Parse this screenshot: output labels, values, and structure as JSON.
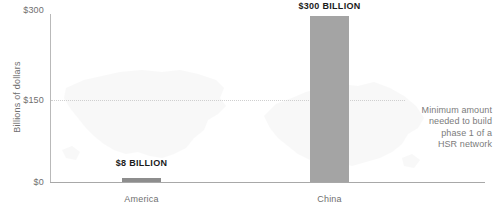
{
  "chart_data": {
    "type": "bar",
    "title": "",
    "subtitle": "",
    "xlabel": "",
    "ylabel": "Billions of dollars",
    "categories": [
      "America",
      "China"
    ],
    "values": [
      8,
      300
    ],
    "value_labels": [
      "$8 BILLION",
      "$300 BILLION"
    ],
    "ylim": [
      0,
      300
    ],
    "yticks": [
      0,
      150,
      300
    ],
    "ytick_labels": [
      "$0",
      "$150",
      "$300"
    ],
    "grid": "horizontal-dotted-at-150-only",
    "legend": "none",
    "annotations": [
      {
        "name": "minimum-amount-note",
        "value": 150,
        "lines": [
          "Minimum amount",
          "needed to build",
          "phase 1 of a",
          "HSR network"
        ]
      }
    ],
    "colors": {
      "bar_america": "#8d8d8d",
      "bar_china": "#a4a4a4",
      "axis": "#b9b9b9",
      "gridline": "#cfcfcf",
      "tick_text": "#6f6f6f",
      "value_text": "#1b1b1b",
      "annotation_text": "#7b7b7b",
      "background": "#ffffff",
      "map_watermark": "#f2f2f2"
    }
  },
  "axis": {
    "y_title": "Billions of dollars",
    "ticks": {
      "top": "$300",
      "middle": "$150",
      "bottom": "$0"
    }
  },
  "bars": {
    "america": {
      "category": "America",
      "value_label": "$8 BILLION"
    },
    "china": {
      "category": "China",
      "value_label": "$300 BILLION"
    }
  },
  "annotation": {
    "line1": "Minimum amount",
    "line2": "needed to build",
    "line3": "phase 1 of a",
    "line4": "HSR network"
  },
  "watermarks": {
    "usa": "usa-map-watermark",
    "china": "china-map-watermark"
  }
}
